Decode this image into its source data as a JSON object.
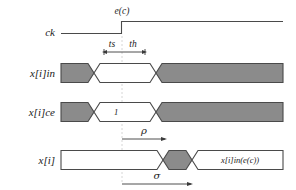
{
  "figure": {
    "type": "timing-diagram"
  },
  "signals": [
    {
      "id": "ck",
      "label": "ck"
    },
    {
      "id": "xiin",
      "label": "x[i]in"
    },
    {
      "id": "xice",
      "label": "x[i]ce"
    },
    {
      "id": "xi",
      "label": "x[i]"
    }
  ],
  "annotations": {
    "clock_event": "e(c)",
    "setup_time": "ts",
    "hold_time": "th",
    "rho": "ρ",
    "sigma": "σ"
  },
  "bus_values": {
    "ce_enable": "1",
    "xi_result": "x[i]in(e(c))"
  },
  "colors": {
    "bus_unknown": "#8b8b8b",
    "bus_valid": "#ffffff",
    "wave_stroke": "#4a4a4a",
    "edge_marker": "#cccccc",
    "text": "#1a1a1a"
  },
  "geometry": {
    "edge_x": 122,
    "wave_start_x": 61,
    "wave_end_x": 283
  }
}
